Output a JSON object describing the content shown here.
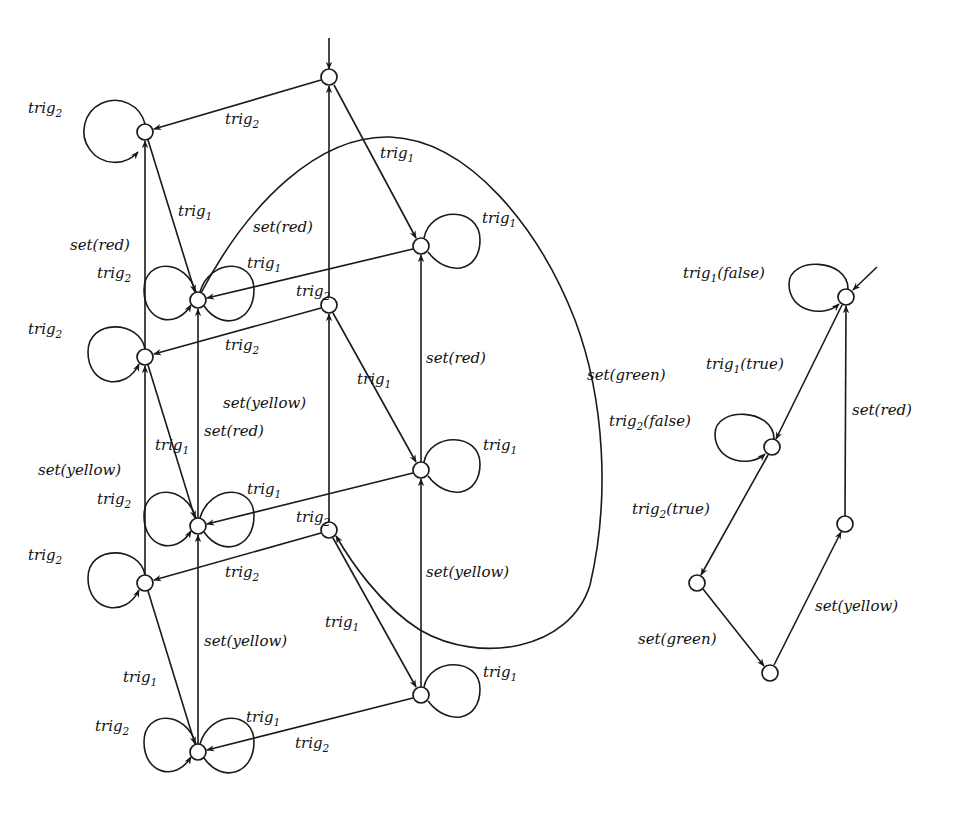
{
  "diagram": {
    "type": "state-machine",
    "colors": {
      "stroke": "#1a1a1a",
      "background": "#ffffff"
    }
  },
  "left_automaton": {
    "nodes": [
      {
        "id": "T",
        "x": 329,
        "y": 77,
        "initial": true
      },
      {
        "id": "N1",
        "x": 145,
        "y": 132
      },
      {
        "id": "N2",
        "x": 421,
        "y": 246
      },
      {
        "id": "A",
        "x": 198,
        "y": 300
      },
      {
        "id": "N3",
        "x": 329,
        "y": 305
      },
      {
        "id": "B",
        "x": 145,
        "y": 357
      },
      {
        "id": "N4",
        "x": 421,
        "y": 470
      },
      {
        "id": "C",
        "x": 198,
        "y": 526
      },
      {
        "id": "N5",
        "x": 329,
        "y": 530
      },
      {
        "id": "D",
        "x": 145,
        "y": 583
      },
      {
        "id": "N6",
        "x": 421,
        "y": 695
      },
      {
        "id": "E",
        "x": 198,
        "y": 752
      }
    ],
    "edges": [
      {
        "from": "T",
        "to": "N1",
        "label": "trig",
        "sub": "2"
      },
      {
        "from": "T",
        "to": "N2",
        "label": "trig",
        "sub": "1"
      },
      {
        "from": "N1",
        "to": "N1",
        "label": "trig",
        "sub": "2"
      },
      {
        "from": "N1",
        "to": "A",
        "label": "trig",
        "sub": "1"
      },
      {
        "from": "B",
        "to": "N1",
        "label": "set(red)"
      },
      {
        "from": "A",
        "to": "A",
        "label": "trig",
        "sub": "2"
      },
      {
        "from": "A",
        "to": "A",
        "label": "trig",
        "sub": "1"
      },
      {
        "from": "N2",
        "to": "N2",
        "label": "trig",
        "sub": "1"
      },
      {
        "from": "N2",
        "to": "A",
        "label": "trig",
        "sub": "2"
      },
      {
        "from": "N3",
        "to": "T",
        "label": "set(red)"
      },
      {
        "from": "N3",
        "to": "B",
        "label": "trig",
        "sub": "2"
      },
      {
        "from": "N3",
        "to": "N4",
        "label": "trig",
        "sub": "1"
      },
      {
        "from": "B",
        "to": "B",
        "label": "trig",
        "sub": "2"
      },
      {
        "from": "B",
        "to": "C",
        "label": "trig",
        "sub": "1"
      },
      {
        "from": "C",
        "to": "A",
        "label": "set(red)"
      },
      {
        "from": "N4",
        "to": "N2",
        "label": "set(red)"
      },
      {
        "from": "N4",
        "to": "N4",
        "label": "trig",
        "sub": "1"
      },
      {
        "from": "N4",
        "to": "C",
        "label": "trig",
        "sub": "2"
      },
      {
        "from": "N5",
        "to": "N3",
        "label": "set(yellow)"
      },
      {
        "from": "N5",
        "to": "D",
        "label": "trig",
        "sub": "2"
      },
      {
        "from": "N5",
        "to": "N6",
        "label": "trig",
        "sub": "1"
      },
      {
        "from": "A",
        "to": "N5",
        "label": "set(green)"
      },
      {
        "from": "D",
        "to": "B",
        "label": "set(yellow)"
      },
      {
        "from": "C",
        "to": "C",
        "label": "trig",
        "sub": "2"
      },
      {
        "from": "C",
        "to": "C",
        "label": "trig",
        "sub": "1"
      },
      {
        "from": "D",
        "to": "D",
        "label": "trig",
        "sub": "2"
      },
      {
        "from": "D",
        "to": "E",
        "label": "trig",
        "sub": "1"
      },
      {
        "from": "E",
        "to": "C",
        "label": "set(yellow)"
      },
      {
        "from": "N6",
        "to": "N4",
        "label": "set(yellow)"
      },
      {
        "from": "N6",
        "to": "N6",
        "label": "trig",
        "sub": "1"
      },
      {
        "from": "N6",
        "to": "E",
        "label": "trig",
        "sub": "2"
      },
      {
        "from": "E",
        "to": "E",
        "label": "trig",
        "sub": "2"
      },
      {
        "from": "E",
        "to": "E",
        "label": "trig",
        "sub": "1"
      }
    ]
  },
  "right_automaton": {
    "nodes": [
      {
        "id": "R1",
        "x": 846,
        "y": 297,
        "initial": true
      },
      {
        "id": "R2",
        "x": 772,
        "y": 447
      },
      {
        "id": "R3",
        "x": 697,
        "y": 583
      },
      {
        "id": "R4",
        "x": 770,
        "y": 673
      },
      {
        "id": "R5",
        "x": 845,
        "y": 524
      }
    ],
    "edges": [
      {
        "from": "R1",
        "to": "R1",
        "label": "trig",
        "sub": "1",
        "guard": "(false)"
      },
      {
        "from": "R1",
        "to": "R2",
        "label": "trig",
        "sub": "1",
        "guard": "(true)"
      },
      {
        "from": "R2",
        "to": "R2",
        "label": "trig",
        "sub": "2",
        "guard": "(false)"
      },
      {
        "from": "R2",
        "to": "R3",
        "label": "trig",
        "sub": "2",
        "guard": "(true)"
      },
      {
        "from": "R3",
        "to": "R4",
        "label": "set(green)"
      },
      {
        "from": "R4",
        "to": "R5",
        "label": "set(yellow)"
      },
      {
        "from": "R5",
        "to": "R1",
        "label": "set(red)"
      }
    ]
  },
  "labels": {
    "trig": "trig",
    "s1": "1",
    "s2": "2",
    "set_red": "set(red)",
    "set_yellow": "set(yellow)",
    "set_green": "set(green)",
    "false": "(false)",
    "true": "(true)"
  }
}
